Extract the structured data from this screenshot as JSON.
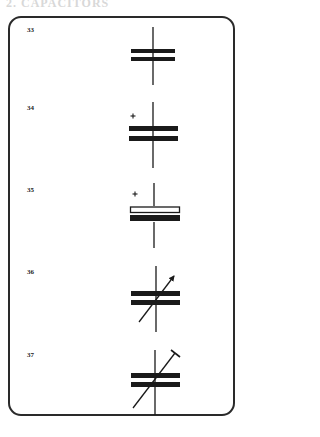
{
  "header": {
    "text": "2. CAPACITORS"
  },
  "diagram": {
    "items": [
      {
        "number": "33",
        "symbol": "capacitor-fixed"
      },
      {
        "number": "34",
        "symbol": "capacitor-polarized",
        "polarity_mark": "+"
      },
      {
        "number": "35",
        "symbol": "capacitor-electrolytic",
        "polarity_mark": "+"
      },
      {
        "number": "36",
        "symbol": "capacitor-variable"
      },
      {
        "number": "37",
        "symbol": "capacitor-trimmer"
      }
    ]
  },
  "colors": {
    "ink": "#1a1a1a",
    "frame": "#2a2a2a",
    "background": "#ffffff"
  }
}
